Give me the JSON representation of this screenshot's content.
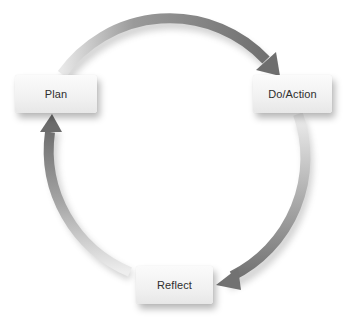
{
  "diagram": {
    "type": "cycle",
    "nodes": [
      {
        "id": "plan",
        "label": "Plan"
      },
      {
        "id": "do",
        "label": "Do/Action"
      },
      {
        "id": "reflect",
        "label": "Reflect"
      }
    ],
    "edges": [
      {
        "from": "plan",
        "to": "do",
        "direction": "clockwise"
      },
      {
        "from": "do",
        "to": "reflect",
        "direction": "clockwise"
      },
      {
        "from": "reflect",
        "to": "plan",
        "direction": "clockwise"
      }
    ],
    "colors": {
      "arrow_dark": "#7a7a7a",
      "arrow_light": "#e6e6e6",
      "node_fill": "#f3f3f3",
      "text": "#2e2e2e"
    }
  }
}
